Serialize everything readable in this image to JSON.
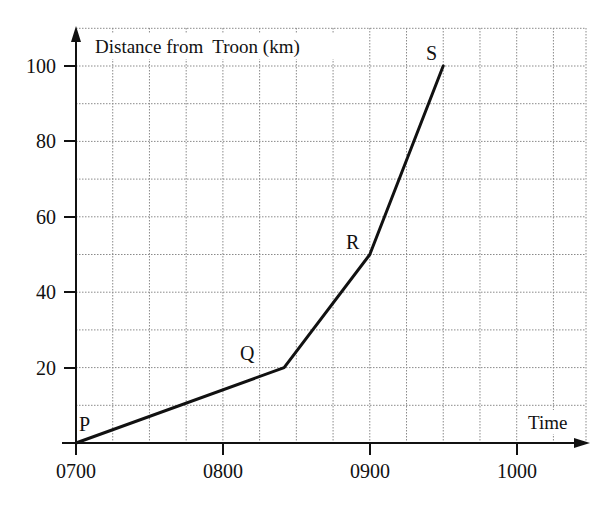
{
  "chart_data": {
    "type": "line",
    "title": "",
    "ylabel": "Distance from  Troon (km)",
    "xlabel": "Time",
    "x_tick_labels": [
      "0700",
      "0800",
      "0900",
      "1000"
    ],
    "y_tick_labels": [
      "20",
      "40",
      "60",
      "80",
      "100"
    ],
    "xlim_minutes_after_0700": [
      0,
      180
    ],
    "ylim": [
      0,
      110
    ],
    "grid": true,
    "grid_x_step_minutes": 15,
    "grid_y_step": 10,
    "legend": null,
    "series": [
      {
        "name": "Journey",
        "points": [
          {
            "label": "P",
            "time": "0700",
            "minutes": 0,
            "distance_km": 0
          },
          {
            "label": "Q",
            "time": "0825",
            "minutes": 85,
            "distance_km": 20
          },
          {
            "label": "R",
            "time": "0900",
            "minutes": 120,
            "distance_km": 50
          },
          {
            "label": "S",
            "time": "0930",
            "minutes": 150,
            "distance_km": 100
          }
        ]
      }
    ]
  },
  "layout": {
    "origin_x": 76,
    "origin_y": 443,
    "px_per_minute": 2.4483,
    "px_per_km": 3.77,
    "grid_right_x": 586,
    "grid_top_y": 28
  },
  "labels": {
    "y_axis_title": "Distance from  Troon (km)",
    "x_axis_title": "Time",
    "p": "P",
    "q": "Q",
    "r": "R",
    "s": "S",
    "x0700": "0700",
    "x0800": "0800",
    "x0900": "0900",
    "x1000": "1000",
    "y20": "20",
    "y40": "40",
    "y60": "60",
    "y80": "80",
    "y100": "100"
  }
}
